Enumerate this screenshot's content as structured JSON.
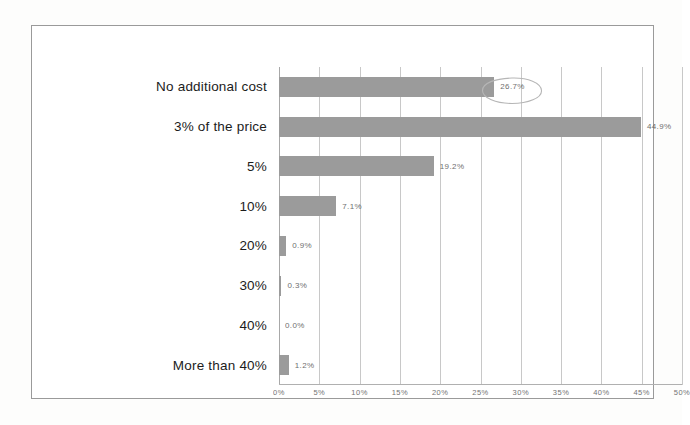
{
  "chart_data": {
    "type": "bar",
    "orientation": "horizontal",
    "title": "",
    "subtitle": "",
    "xlabel": "",
    "ylabel": "",
    "categories": [
      "No additional cost",
      "3% of the price",
      "5%",
      "10%",
      "20%",
      "30%",
      "40%",
      "More than 40%"
    ],
    "values": [
      26.7,
      44.9,
      19.2,
      7.1,
      0.9,
      0.3,
      0.0,
      1.2
    ],
    "value_labels": [
      "26.7%",
      "44.9%",
      "19.2%",
      "7.1%",
      "0.9%",
      "0.3%",
      "0.0%",
      "1.2%"
    ],
    "xlim": [
      0,
      50
    ],
    "xticks": [
      0,
      5,
      10,
      15,
      20,
      25,
      30,
      35,
      40,
      45,
      50
    ],
    "xtick_labels": [
      "0%",
      "5%",
      "10%",
      "15%",
      "20%",
      "25%",
      "30%",
      "35%",
      "40%",
      "45%",
      "50%"
    ],
    "grid": true,
    "grid_axis": "x",
    "legend": false,
    "legend_position": "none",
    "bar_color": "#9b9b9b",
    "grid_color": "#c8c8c8",
    "text_color": "#1c1c1c",
    "value_label_color": "#555555",
    "annotations": [
      {
        "type": "ellipse",
        "target": "26.7%",
        "style": "hand-drawn",
        "color": "#b4b4b4"
      }
    ]
  }
}
